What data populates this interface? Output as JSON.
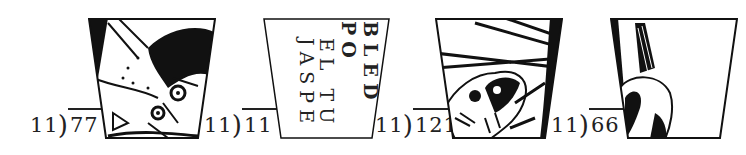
{
  "problems": [
    {
      "divisor": "11",
      "dividend": "77",
      "x": 30
    },
    {
      "divisor": "11",
      "dividend": "11",
      "x": 204
    },
    {
      "divisor": "11",
      "dividend": "121",
      "x": 375
    },
    {
      "divisor": "11",
      "dividend": "66",
      "x": 551
    }
  ],
  "panels": [
    {
      "id": "panel-1",
      "content": "illustration-animal-face-closeup"
    },
    {
      "id": "panel-2",
      "content": "text-fragments",
      "lines": [
        "BLED PO",
        "EL TU",
        "JASPE"
      ]
    },
    {
      "id": "panel-3",
      "content": "illustration-animal-among-branches"
    },
    {
      "id": "panel-4",
      "content": "illustration-tail-and-fur"
    }
  ]
}
